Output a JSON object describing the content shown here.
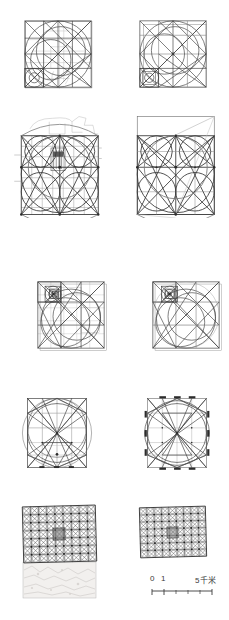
{
  "figure": {
    "title": "",
    "kind": "geometric-analysis-plate",
    "rows": 5,
    "columns": 2,
    "ink_color": "#3c3c3c",
    "faint_color": "#b8b8b8",
    "page_background": "#ffffff"
  },
  "panels": [
    {
      "id": "r1c1",
      "label": "row-1-left",
      "type": "square-circle-construction",
      "has_underlay_map": true,
      "x": 22,
      "y": 18,
      "w": 72,
      "h": 72
    },
    {
      "id": "r1c2",
      "label": "row-1-right",
      "type": "square-circle-construction",
      "has_underlay_map": false,
      "x": 137,
      "y": 18,
      "w": 72,
      "h": 72
    },
    {
      "id": "r2c1",
      "label": "row-2-left",
      "type": "walled-city-grid-construction",
      "has_underlay_map": true,
      "x": 14,
      "y": 113,
      "w": 88,
      "h": 105
    },
    {
      "id": "r2c2",
      "label": "row-2-right",
      "type": "walled-city-grid-construction",
      "has_underlay_map": false,
      "x": 130,
      "y": 113,
      "w": 88,
      "h": 105
    },
    {
      "id": "r3c1",
      "label": "row-3-left",
      "type": "spiral-square-construction",
      "has_underlay_map": true,
      "x": 35,
      "y": 279,
      "w": 72,
      "h": 72
    },
    {
      "id": "r3c2",
      "label": "row-3-right",
      "type": "spiral-square-construction",
      "has_underlay_map": false,
      "x": 150,
      "y": 279,
      "w": 72,
      "h": 72
    },
    {
      "id": "r4c1",
      "label": "row-4-left",
      "type": "inscribed-circle-polygon-construction",
      "has_underlay_map": true,
      "has_perimeter_ticks": false,
      "x": 20,
      "y": 394,
      "w": 74,
      "h": 78
    },
    {
      "id": "r4c2",
      "label": "row-4-right",
      "type": "inscribed-circle-polygon-construction",
      "has_underlay_map": false,
      "has_perimeter_ticks": true,
      "x": 140,
      "y": 394,
      "w": 74,
      "h": 78
    },
    {
      "id": "r5c1",
      "label": "row-5-left",
      "type": "module-grid-with-photo",
      "has_underlay_map": true,
      "grid_cols": 9,
      "grid_rows": 7,
      "x": 23,
      "y": 506,
      "w": 76,
      "h": 56
    },
    {
      "id": "r5c2",
      "label": "row-5-right",
      "type": "module-grid",
      "has_underlay_map": false,
      "grid_cols": 9,
      "grid_rows": 7,
      "x": 139,
      "y": 506,
      "w": 68,
      "h": 52
    }
  ],
  "scale_bar": {
    "name": "scale-bar",
    "zero_label": "0",
    "one_label": "1",
    "max_label": "5千米",
    "unit": "千米",
    "segments": 5
  }
}
